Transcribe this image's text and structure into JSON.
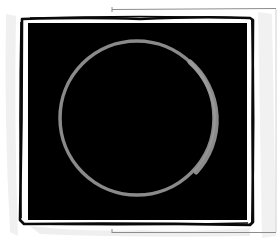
{
  "image": {
    "subject": "ring-in-framed-black-square",
    "colors": {
      "background": "#ffffff",
      "paper_shadow": "#e6e6e6",
      "back_sheet_line": "#8c8c8c",
      "frame_ink": "#0a0a0a",
      "inner_mat": "#ffffff",
      "canvas": "#000000",
      "ring": "#8a8a8a",
      "ring_highlight": "#a0a0a0"
    },
    "ring": {
      "cx": 137,
      "cy": 118,
      "r": 77,
      "stroke": 3.5
    }
  }
}
